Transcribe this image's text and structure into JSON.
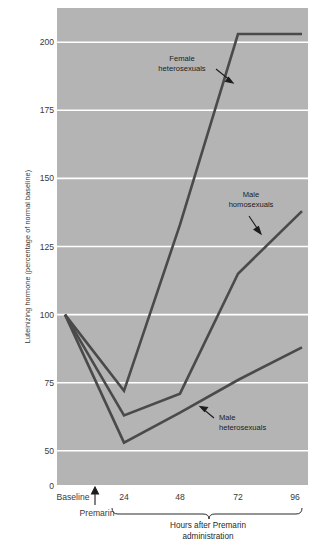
{
  "chart_data": {
    "type": "line",
    "title": "",
    "xlabel": "Hours after Premarin administration",
    "ylabel": "Luteinizing hormone (percentage of normal baseline)",
    "x_tick_labels": [
      "Baseline",
      "24",
      "48",
      "72",
      "96"
    ],
    "x_positions": [
      0,
      24,
      48,
      72,
      96
    ],
    "y_tick_labels": [
      "0",
      "50",
      "75",
      "100",
      "125",
      "150",
      "175",
      "200"
    ],
    "y_tick_values": [
      0,
      50,
      75,
      100,
      125,
      150,
      175,
      200
    ],
    "ylim": [
      0,
      215
    ],
    "grid": "horizontal-white",
    "legend": "inline-annotations",
    "plot_background": "#b4b4b4",
    "line_color": "#4a4a4a",
    "grid_color": "#ffffff",
    "series": [
      {
        "name": "Female heterosexuals",
        "values": [
          100,
          72,
          133,
          203,
          203
        ],
        "label_line1": "Female",
        "label_line2": "heterosexuals"
      },
      {
        "name": "Male homosexuals",
        "values": [
          100,
          63,
          71,
          115,
          138
        ],
        "label_line1": "Male",
        "label_line2": "homosexuals"
      },
      {
        "name": "Male heterosexuals",
        "values": [
          100,
          53,
          64,
          76,
          88
        ],
        "label_line1": "Male",
        "label_line2": "heterosexuals"
      }
    ],
    "annotations": [
      {
        "text": "Premarin",
        "kind": "arrow-up-marker",
        "x": 12
      }
    ]
  }
}
